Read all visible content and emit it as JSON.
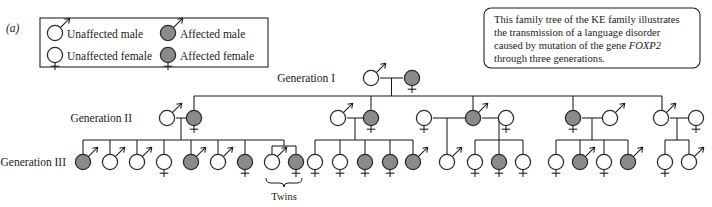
{
  "figure": {
    "panel_label": "(a)",
    "caption": {
      "line1": "This family tree of the KE family illustrates",
      "line2": "the transmission of a language disorder",
      "line3_pre": "caused by mutation of the gene ",
      "line3_gene": "FOXP2",
      "line4": "through three generations."
    }
  },
  "legend": {
    "items": [
      {
        "key": "unaffected-male",
        "label": "Unaffected male",
        "sex": "male",
        "affected": false
      },
      {
        "key": "affected-male",
        "label": "Affected male",
        "sex": "male",
        "affected": true
      },
      {
        "key": "unaffected-female",
        "label": "Unaffected female",
        "sex": "female",
        "affected": false
      },
      {
        "key": "affected-female",
        "label": "Affected female",
        "sex": "female",
        "affected": true
      }
    ]
  },
  "generations": {
    "one": "Generation I",
    "two": "Generation II",
    "three": "Generation III"
  },
  "annotations": {
    "twins": "Twins"
  },
  "colors": {
    "affected_fill": "#8a8a8a",
    "unaffected_fill": "#ffffff",
    "stroke": "#2b2b2b",
    "line": "#1a1a1a"
  },
  "chart_data": {
    "type": "pedigree",
    "generation_count": 3,
    "generation_I": [
      {
        "id": "I-1",
        "sex": "male",
        "affected": false,
        "x": 371,
        "y": 78
      },
      {
        "id": "I-2",
        "sex": "female",
        "affected": true,
        "x": 412,
        "y": 78
      }
    ],
    "generation_II": [
      {
        "id": "II-1",
        "sex": "male",
        "affected": false,
        "x": 167,
        "y": 118
      },
      {
        "id": "II-2",
        "sex": "female",
        "affected": true,
        "x": 194,
        "y": 118
      },
      {
        "id": "II-3",
        "sex": "male",
        "affected": false,
        "x": 338,
        "y": 118
      },
      {
        "id": "II-4",
        "sex": "female",
        "affected": true,
        "x": 371,
        "y": 118
      },
      {
        "id": "II-5",
        "sex": "female",
        "affected": false,
        "x": 424,
        "y": 118
      },
      {
        "id": "II-6",
        "sex": "male",
        "affected": true,
        "x": 473,
        "y": 118
      },
      {
        "id": "II-7",
        "sex": "female",
        "affected": false,
        "x": 506,
        "y": 118
      },
      {
        "id": "II-8",
        "sex": "female",
        "affected": true,
        "x": 573,
        "y": 118
      },
      {
        "id": "II-9",
        "sex": "male",
        "affected": false,
        "x": 610,
        "y": 118
      },
      {
        "id": "II-10",
        "sex": "male",
        "affected": false,
        "x": 661,
        "y": 118
      },
      {
        "id": "II-11",
        "sex": "female",
        "affected": false,
        "x": 696,
        "y": 118
      }
    ],
    "generation_III": [
      {
        "id": "III-1",
        "sex": "male",
        "affected": true,
        "x": 83,
        "y": 162,
        "parents": "II-1xII-2"
      },
      {
        "id": "III-2",
        "sex": "male",
        "affected": false,
        "x": 110,
        "y": 162,
        "parents": "II-1xII-2"
      },
      {
        "id": "III-3",
        "sex": "male",
        "affected": false,
        "x": 137,
        "y": 162,
        "parents": "II-1xII-2"
      },
      {
        "id": "III-4",
        "sex": "female",
        "affected": false,
        "x": 164,
        "y": 162,
        "parents": "II-1xII-2"
      },
      {
        "id": "III-5",
        "sex": "male",
        "affected": true,
        "x": 191,
        "y": 162,
        "parents": "II-1xII-2"
      },
      {
        "id": "III-6",
        "sex": "male",
        "affected": false,
        "x": 218,
        "y": 162,
        "parents": "II-1xII-2"
      },
      {
        "id": "III-7",
        "sex": "female",
        "affected": true,
        "x": 245,
        "y": 162,
        "parents": "II-1xII-2"
      },
      {
        "id": "III-8",
        "sex": "male",
        "affected": false,
        "x": 272,
        "y": 162,
        "parents": "II-1xII-2",
        "twin": true
      },
      {
        "id": "III-9",
        "sex": "female",
        "affected": true,
        "x": 296,
        "y": 162,
        "parents": "II-1xII-2",
        "twin": true
      },
      {
        "id": "III-10",
        "sex": "female",
        "affected": false,
        "x": 315,
        "y": 162,
        "parents": "II-3xII-4"
      },
      {
        "id": "III-11",
        "sex": "female",
        "affected": false,
        "x": 340,
        "y": 162,
        "parents": "II-3xII-4"
      },
      {
        "id": "III-12",
        "sex": "female",
        "affected": true,
        "x": 365,
        "y": 162,
        "parents": "II-3xII-4"
      },
      {
        "id": "III-13",
        "sex": "female",
        "affected": true,
        "x": 390,
        "y": 162,
        "parents": "II-3xII-4"
      },
      {
        "id": "III-14",
        "sex": "male",
        "affected": true,
        "x": 413,
        "y": 162,
        "parents": "II-3xII-4"
      },
      {
        "id": "III-15",
        "sex": "male",
        "affected": false,
        "x": 447,
        "y": 162,
        "parents": "II-5xII-6"
      },
      {
        "id": "III-16",
        "sex": "female",
        "affected": false,
        "x": 475,
        "y": 162,
        "parents": "II-6xII-7"
      },
      {
        "id": "III-17",
        "sex": "female",
        "affected": true,
        "x": 499,
        "y": 162,
        "parents": "II-6xII-7"
      },
      {
        "id": "III-18",
        "sex": "female",
        "affected": false,
        "x": 523,
        "y": 162,
        "parents": "II-6xII-7"
      },
      {
        "id": "III-19",
        "sex": "female",
        "affected": false,
        "x": 556,
        "y": 162,
        "parents": "II-8xII-9"
      },
      {
        "id": "III-20",
        "sex": "male",
        "affected": true,
        "x": 580,
        "y": 162,
        "parents": "II-8xII-9"
      },
      {
        "id": "III-21",
        "sex": "female",
        "affected": false,
        "x": 604,
        "y": 162,
        "parents": "II-8xII-9"
      },
      {
        "id": "III-22",
        "sex": "male",
        "affected": true,
        "x": 628,
        "y": 162,
        "parents": "II-8xII-9"
      },
      {
        "id": "III-23",
        "sex": "female",
        "affected": false,
        "x": 665,
        "y": 162,
        "parents": "II-10xII-11"
      },
      {
        "id": "III-24",
        "sex": "male",
        "affected": false,
        "x": 689,
        "y": 162,
        "parents": "II-10xII-11"
      }
    ]
  }
}
